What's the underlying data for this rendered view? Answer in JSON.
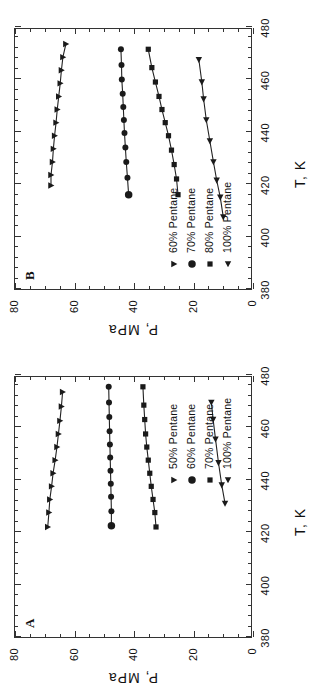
{
  "figure": {
    "orientation_deg": -90,
    "background": "#ffffff",
    "ink_color": "#222222"
  },
  "panels": [
    {
      "id": "B",
      "letter": "B",
      "position": "top",
      "xlabel": "T, K",
      "ylabel": "P, MPa",
      "xticks": [
        380,
        400,
        420,
        440,
        460,
        480
      ],
      "yticks": [
        0,
        20,
        40,
        60,
        80
      ],
      "xlim": [
        380,
        480
      ],
      "ylim": [
        0,
        80
      ],
      "legend": [
        {
          "label": "60% Pentane",
          "marker": "triangle-down"
        },
        {
          "label": "70% Pentane",
          "marker": "circle"
        },
        {
          "label": "80% Pentane",
          "marker": "square"
        },
        {
          "label": "100% Pentane",
          "marker": "triangle-left"
        }
      ]
    },
    {
      "id": "A",
      "letter": "A",
      "position": "bottom",
      "xlabel": "T, K",
      "ylabel": "P, MPa",
      "xticks": [
        380,
        400,
        420,
        440,
        460,
        480
      ],
      "yticks": [
        0,
        20,
        40,
        60,
        80
      ],
      "xlim": [
        380,
        480
      ],
      "ylim": [
        0,
        80
      ],
      "legend": [
        {
          "label": "50% Pentane",
          "marker": "triangle-down"
        },
        {
          "label": "60% Pentane",
          "marker": "circle"
        },
        {
          "label": "70% Pentane",
          "marker": "square"
        },
        {
          "label": "100% Pentane",
          "marker": "triangle-left"
        }
      ]
    }
  ],
  "chart_data": [
    {
      "type": "line",
      "panel": "B",
      "title": "B",
      "xlabel": "T, K",
      "ylabel": "P, MPa",
      "xlim": [
        380,
        480
      ],
      "ylim": [
        0,
        80
      ],
      "grid": false,
      "legend_position": "lower-left",
      "series": [
        {
          "name": "60% Pentane",
          "marker": "triangle-down",
          "x": [
            419.5,
            423.5,
            428.5,
            433.5,
            438.5,
            443.5,
            448.5,
            453.5,
            458.5,
            463.5,
            468.5,
            473.5
          ],
          "y": [
            67.9,
            67.9,
            67.4,
            67.1,
            66.7,
            66.2,
            65.8,
            65.3,
            64.8,
            64.4,
            63.9,
            62.9
          ]
        },
        {
          "name": "70% Pentane",
          "marker": "circle",
          "x": [
            416.0,
            422.5,
            428.5,
            434.0,
            439.5,
            444.5,
            449.5,
            454.5,
            460.0,
            465.5,
            471.5
          ],
          "y": [
            41.8,
            42.2,
            42.6,
            42.9,
            43.2,
            43.4,
            43.6,
            43.8,
            44.1,
            44.2,
            44.4
          ]
        },
        {
          "name": "80% Pentane",
          "marker": "square",
          "x": [
            416.0,
            422.0,
            427.5,
            433.0,
            438.5,
            443.5,
            448.5,
            453.5,
            459.0,
            464.5,
            471.5
          ],
          "y": [
            25.2,
            25.7,
            26.5,
            27.4,
            28.4,
            29.5,
            30.6,
            31.6,
            32.8,
            34.0,
            35.2
          ]
        },
        {
          "name": "100% Pentane",
          "marker": "triangle-left",
          "x": [
            407.5,
            415.0,
            421.5,
            428.5,
            436.5,
            444.5,
            452.5,
            459.0,
            467.5
          ],
          "y": [
            10.0,
            11.0,
            12.2,
            13.3,
            14.5,
            15.7,
            16.6,
            17.2,
            18.2
          ]
        }
      ]
    },
    {
      "type": "line",
      "panel": "A",
      "title": "A",
      "xlabel": "T, K",
      "ylabel": "P, MPa",
      "xlim": [
        380,
        480
      ],
      "ylim": [
        0,
        80
      ],
      "grid": false,
      "legend_position": "lower-right",
      "series": [
        {
          "name": "50% Pentane",
          "marker": "triangle-down",
          "x": [
            422.0,
            427.5,
            432.5,
            437.5,
            442.5,
            447.5,
            452.5,
            457.5,
            462.5,
            468.0,
            473.5
          ],
          "y": [
            69.0,
            68.6,
            68.3,
            67.7,
            67.2,
            66.5,
            65.9,
            65.4,
            64.9,
            64.4,
            64.0
          ]
        },
        {
          "name": "60% Pentane",
          "marker": "circle",
          "x": [
            422.5,
            428.0,
            433.5,
            438.5,
            443.5,
            448.5,
            453.5,
            458.5,
            464.0,
            469.5,
            475.5
          ],
          "y": [
            47.6,
            47.6,
            47.7,
            47.8,
            47.9,
            48.0,
            48.1,
            48.2,
            48.3,
            48.4,
            48.5
          ]
        },
        {
          "name": "70% Pentane",
          "marker": "square",
          "x": [
            422.0,
            427.5,
            432.5,
            437.5,
            442.5,
            447.5,
            452.5,
            457.5,
            463.0,
            468.5,
            475.5
          ],
          "y": [
            32.6,
            33.0,
            33.6,
            34.2,
            34.7,
            35.2,
            35.7,
            36.1,
            36.4,
            36.7,
            37.0
          ]
        },
        {
          "name": "100% Pentane",
          "marker": "triangle-left",
          "x": [
            431.0,
            438.0,
            446.5,
            455.5,
            463.0,
            469.5
          ],
          "y": [
            9.4,
            10.5,
            11.6,
            12.6,
            13.4,
            14.0
          ]
        }
      ]
    }
  ]
}
